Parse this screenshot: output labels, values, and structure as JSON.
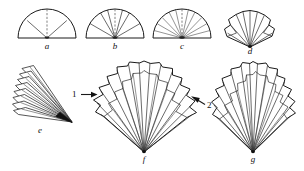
{
  "figure": {
    "background_color": "#ffffff",
    "ink_color": "#1a1a1a",
    "width": 304,
    "height": 171
  },
  "panels": [
    {
      "id": "a",
      "caption": "a",
      "shape": "semicircle",
      "description": "half disc with two solid radial creases and one dashed center crease",
      "radial_lines": 2,
      "dashed_center_line": true,
      "sector_count": 4
    },
    {
      "id": "b",
      "caption": "b",
      "shape": "semicircle",
      "description": "half disc subdivided by six radial creases, center crease dashed",
      "radial_lines": 6,
      "dashed_center_line": true,
      "sector_count": 8
    },
    {
      "id": "c",
      "caption": "c",
      "shape": "semicircle",
      "description": "half disc subdivided by ten radial creases, center crease dashed",
      "radial_lines": 10,
      "dashed_center_line": true,
      "sector_count": 12
    },
    {
      "id": "d",
      "caption": "d",
      "shape": "folded-fan",
      "description": "partly pleated fan, scalloped upper rim, creases converging at base pivot",
      "radial_lines": 8,
      "dashed_center_line": false,
      "sector_count": 9
    },
    {
      "id": "e",
      "caption": "e",
      "shape": "collapsed-fan",
      "description": "fan folded shut into a narrow stack of blades pointing down-right",
      "radial_lines": 9,
      "dashed_center_line": false,
      "sector_count": 9
    },
    {
      "id": "f",
      "caption": "f",
      "shape": "open-fan",
      "description": "fully opened pleated fan, wide scalloped rim, ribs meeting at bottom pivot",
      "radial_lines": 14,
      "dashed_center_line": false,
      "sector_count": 15
    },
    {
      "id": "g",
      "caption": "g",
      "shape": "open-fan",
      "description": "opened pleated fan, narrower spread than f, scalloped rim",
      "radial_lines": 13,
      "dashed_center_line": false,
      "sector_count": 14
    }
  ],
  "callouts": [
    {
      "id": "1",
      "label": "1",
      "arrow": "→",
      "direction": "right",
      "points_to": "f-left-edge"
    },
    {
      "id": "2",
      "label": "2",
      "arrow": "←",
      "direction": "upper-left",
      "points_to": "f-right-edge"
    }
  ]
}
